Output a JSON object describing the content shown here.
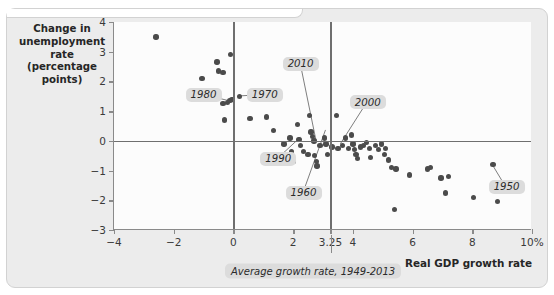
{
  "chart_data": {
    "type": "scatter",
    "title": "",
    "xlabel": "Real GDP growth rate",
    "ylabel": "Change in unemployment rate (percentage points)",
    "xlim": [
      -4,
      10
    ],
    "ylim": [
      -3,
      4
    ],
    "grid": false,
    "legend": "none",
    "x_ticks": [
      "-4",
      "-2",
      "0",
      "2",
      "3.25",
      "4",
      "6",
      "8",
      "10%"
    ],
    "x_tick_values": [
      -4,
      -2,
      0,
      2,
      3.25,
      4,
      6,
      8,
      10
    ],
    "y_ticks": [
      "4",
      "3",
      "2",
      "1",
      "0",
      "-1",
      "-2",
      "-3"
    ],
    "y_tick_values": [
      4,
      3,
      2,
      1,
      0,
      -1,
      -2,
      -3
    ],
    "reference_lines": [
      {
        "axis": "x",
        "value": 0,
        "label": ""
      },
      {
        "axis": "x",
        "value": 3.25,
        "label": "Average growth rate, 1949-2013"
      },
      {
        "axis": "y",
        "value": 0,
        "label": ""
      }
    ],
    "points": [
      {
        "x": -2.6,
        "y": 3.5
      },
      {
        "x": -1.05,
        "y": 2.1
      },
      {
        "x": -0.55,
        "y": 2.65
      },
      {
        "x": -0.5,
        "y": 2.35
      },
      {
        "x": -0.35,
        "y": 2.3
      },
      {
        "x": -0.1,
        "y": 2.9
      },
      {
        "x": -0.35,
        "y": 1.25
      },
      {
        "x": -0.2,
        "y": 1.3
      },
      {
        "x": -0.12,
        "y": 1.35
      },
      {
        "x": -0.05,
        "y": 1.4
      },
      {
        "x": -0.3,
        "y": 0.7
      },
      {
        "x": 0.2,
        "y": 1.5
      },
      {
        "x": 0.55,
        "y": 0.75
      },
      {
        "x": 1.1,
        "y": 0.8
      },
      {
        "x": 1.35,
        "y": 0.35
      },
      {
        "x": 1.7,
        "y": -0.1
      },
      {
        "x": 1.9,
        "y": 0.1
      },
      {
        "x": 1.95,
        "y": -0.35
      },
      {
        "x": 2.0,
        "y": -0.7
      },
      {
        "x": 2.15,
        "y": 0.55
      },
      {
        "x": 2.2,
        "y": 0.05
      },
      {
        "x": 2.35,
        "y": -0.35
      },
      {
        "x": 2.55,
        "y": 0.85
      },
      {
        "x": 2.6,
        "y": 0.3
      },
      {
        "x": 2.65,
        "y": 0.15
      },
      {
        "x": 2.7,
        "y": 0.0
      },
      {
        "x": 2.72,
        "y": -0.5
      },
      {
        "x": 2.78,
        "y": -0.7
      },
      {
        "x": 2.8,
        "y": -0.85
      },
      {
        "x": 2.5,
        "y": -0.45
      },
      {
        "x": 3.05,
        "y": 0.1
      },
      {
        "x": 3.1,
        "y": -0.1
      },
      {
        "x": 3.3,
        "y": -0.2
      },
      {
        "x": 3.45,
        "y": 0.85
      },
      {
        "x": 3.5,
        "y": -0.25
      },
      {
        "x": 3.65,
        "y": -0.15
      },
      {
        "x": 3.75,
        "y": 0.1
      },
      {
        "x": 3.85,
        "y": -0.25
      },
      {
        "x": 3.95,
        "y": 0.2
      },
      {
        "x": 4.0,
        "y": -0.1
      },
      {
        "x": 4.05,
        "y": -0.3
      },
      {
        "x": 4.1,
        "y": -0.45
      },
      {
        "x": 4.15,
        "y": -0.6
      },
      {
        "x": 4.25,
        "y": -0.2
      },
      {
        "x": 4.35,
        "y": -0.15
      },
      {
        "x": 4.45,
        "y": -0.05
      },
      {
        "x": 4.55,
        "y": -0.25
      },
      {
        "x": 4.6,
        "y": -0.55
      },
      {
        "x": 4.75,
        "y": -0.15
      },
      {
        "x": 4.85,
        "y": -0.3
      },
      {
        "x": 4.95,
        "y": -0.1
      },
      {
        "x": 5.05,
        "y": -0.45
      },
      {
        "x": 5.1,
        "y": -0.25
      },
      {
        "x": 5.2,
        "y": -0.65
      },
      {
        "x": 5.3,
        "y": -0.9
      },
      {
        "x": 5.45,
        "y": -0.95
      },
      {
        "x": 5.4,
        "y": -2.3
      },
      {
        "x": 5.9,
        "y": -1.15
      },
      {
        "x": 6.5,
        "y": -0.95
      },
      {
        "x": 6.6,
        "y": -0.9
      },
      {
        "x": 6.95,
        "y": -1.25
      },
      {
        "x": 7.2,
        "y": -1.2
      },
      {
        "x": 7.1,
        "y": -1.75
      },
      {
        "x": 8.05,
        "y": -1.9
      },
      {
        "x": 8.7,
        "y": -0.8
      },
      {
        "x": 8.85,
        "y": -2.05
      },
      {
        "x": 2.9,
        "y": -0.15
      },
      {
        "x": 3.15,
        "y": -0.45
      },
      {
        "x": 1.55,
        "y": -0.7
      },
      {
        "x": 2.25,
        "y": -0.15
      }
    ],
    "annotations": [
      {
        "label": "1980",
        "lx": -1.0,
        "ly": 1.55,
        "px": -0.12,
        "py": 1.33
      },
      {
        "label": "1970",
        "lx": 1.05,
        "ly": 1.55,
        "px": 0.2,
        "py": 1.5
      },
      {
        "label": "2010",
        "lx": 2.25,
        "ly": 2.6,
        "px": 2.78,
        "py": 0.0
      },
      {
        "label": "2000",
        "lx": 4.5,
        "ly": 1.3,
        "px": 3.6,
        "py": -0.12
      },
      {
        "label": "1990",
        "lx": 1.5,
        "ly": -0.6,
        "px": 2.25,
        "py": 0.1
      },
      {
        "label": "1960",
        "lx": 2.35,
        "ly": -1.75,
        "px": 3.1,
        "py": 0.35
      },
      {
        "label": "1950",
        "lx": 9.15,
        "ly": -1.55,
        "px": 8.7,
        "py": -0.8
      }
    ]
  }
}
